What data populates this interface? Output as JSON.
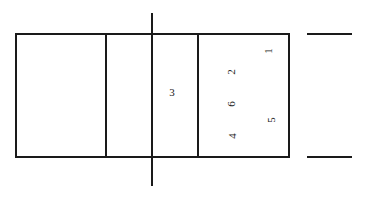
{
  "diagram": {
    "type": "volleyball-court-rotation",
    "colors": {
      "line": "#1a1a1a",
      "background": "#ffffff"
    },
    "court": {
      "outer_rect": {
        "x": 16,
        "y": 34,
        "width": 273,
        "height": 123
      },
      "center_line_x": 152,
      "center_line_extent": {
        "y1": 13,
        "y2": 186
      },
      "attack_lines_x": [
        106,
        198
      ],
      "side_marks": [
        {
          "x1": 307,
          "x2": 352,
          "y": 34
        },
        {
          "x1": 307,
          "x2": 352,
          "y": 157
        }
      ]
    },
    "positions": [
      {
        "label": "1",
        "x": 268,
        "y": 51,
        "rotate": -90
      },
      {
        "label": "2",
        "x": 231,
        "y": 72,
        "rotate": -90
      },
      {
        "label": "3",
        "x": 172,
        "y": 92,
        "rotate": 0
      },
      {
        "label": "6",
        "x": 231,
        "y": 104,
        "rotate": -90
      },
      {
        "label": "5",
        "x": 271,
        "y": 120,
        "rotate": -90
      },
      {
        "label": "4",
        "x": 232,
        "y": 136,
        "rotate": -90
      }
    ]
  }
}
